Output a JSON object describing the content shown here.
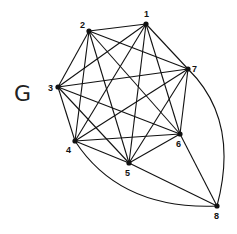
{
  "graph": {
    "name": "G",
    "nodes": [
      {
        "id": "1",
        "x": 146,
        "y": 24,
        "lx": 144,
        "ly": 17
      },
      {
        "id": "2",
        "x": 89,
        "y": 31,
        "lx": 80,
        "ly": 28
      },
      {
        "id": "3",
        "x": 58,
        "y": 87,
        "lx": 48,
        "ly": 91
      },
      {
        "id": "4",
        "x": 75,
        "y": 141,
        "lx": 66,
        "ly": 153
      },
      {
        "id": "5",
        "x": 129,
        "y": 163,
        "lx": 125,
        "ly": 176
      },
      {
        "id": "6",
        "x": 180,
        "y": 134,
        "lx": 176,
        "ly": 147
      },
      {
        "id": "7",
        "x": 188,
        "y": 69,
        "lx": 192,
        "ly": 72
      },
      {
        "id": "8",
        "x": 217,
        "y": 206,
        "lx": 214,
        "ly": 219
      }
    ],
    "edges": [
      [
        "1",
        "2"
      ],
      [
        "1",
        "3"
      ],
      [
        "1",
        "4"
      ],
      [
        "1",
        "5"
      ],
      [
        "1",
        "6"
      ],
      [
        "1",
        "7"
      ],
      [
        "2",
        "3"
      ],
      [
        "2",
        "4"
      ],
      [
        "2",
        "5"
      ],
      [
        "2",
        "6"
      ],
      [
        "2",
        "7"
      ],
      [
        "3",
        "4"
      ],
      [
        "3",
        "5"
      ],
      [
        "3",
        "6"
      ],
      [
        "3",
        "7"
      ],
      [
        "4",
        "5"
      ],
      [
        "4",
        "6"
      ],
      [
        "4",
        "7"
      ],
      [
        "5",
        "6"
      ],
      [
        "5",
        "7"
      ],
      [
        "6",
        "7"
      ],
      [
        "5",
        "8"
      ],
      [
        "6",
        "8"
      ]
    ],
    "curved_edges": [
      {
        "from": "4",
        "to": "8",
        "cx": 120,
        "cy": 210
      },
      {
        "from": "7",
        "to": "8",
        "cx": 240,
        "cy": 120
      }
    ]
  }
}
